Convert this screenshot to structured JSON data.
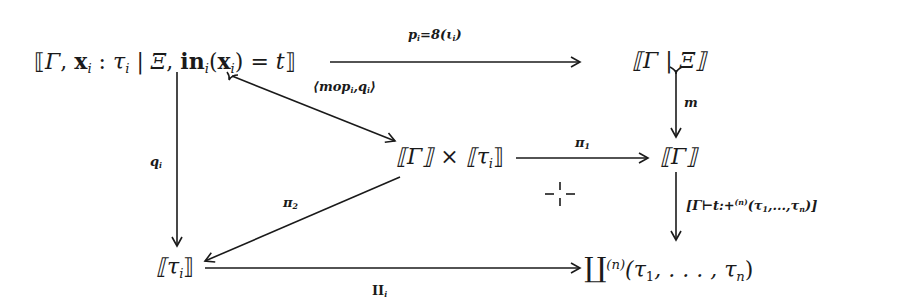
{
  "diagram": {
    "type": "commutative-diagram",
    "nodes": {
      "top_left": {
        "open": "⟦",
        "gamma": "Γ",
        "comma1": ", ",
        "x": "x",
        "x_sub": "i",
        "colon": " : ",
        "tau": "τ",
        "tau_sub": "i",
        "bar": " | ",
        "xi": "Ξ",
        "comma2": ", ",
        "in": "in",
        "in_sub": "i",
        "paren_open": "(",
        "x2": "x",
        "x2_sub": "i",
        "paren_close": ")",
        "eq": " = ",
        "t": "t",
        "close": "⟧"
      },
      "top_right": {
        "text": "⟦Γ | Ξ⟧"
      },
      "middle_left": {
        "gamma": "⟦Γ⟧",
        "times": " × ",
        "tau_open": "⟦τ",
        "tau_sub": "i",
        "tau_close": "⟧"
      },
      "middle_right": {
        "text": "⟦Γ⟧"
      },
      "bottom_left": {
        "open": "⟦τ",
        "sub": "i",
        "close": "⟧"
      },
      "bottom_right": {
        "coprod": "∐",
        "sup": "(n)",
        "args": "(τ",
        "s1": "1",
        "mid": ", . . . , τ",
        "sn": "n",
        "close": ")"
      }
    },
    "arrows": {
      "top": {
        "label_main": "p",
        "label_sub": "i",
        "label_rest": "=8(ι",
        "label_sub2": "i",
        "label_close": ")",
        "from": "top_left",
        "to": "top_right"
      },
      "diag_mop": {
        "label": "⟨mop",
        "label_sub": "i",
        "label_mid": ",q",
        "label_sub2": "i",
        "label_close": "⟩",
        "from": "top_left",
        "to": "middle_left"
      },
      "m": {
        "label": "m",
        "from": "top_right",
        "to": "middle_right"
      },
      "q": {
        "label": "q",
        "label_sub": "i",
        "from": "top_left",
        "to": "bottom_left"
      },
      "pi1": {
        "label": "π",
        "label_sub": "1",
        "from": "middle_left",
        "to": "middle_right"
      },
      "pi2": {
        "label": "π",
        "label_sub": "2",
        "from": "middle_left",
        "to": "bottom_left"
      },
      "judgement": {
        "label": "[Γ⊢t:+",
        "label_sup": "(n)",
        "label_rest": "(τ",
        "s1": "1",
        "mid": ",...,τ",
        "sn": "n",
        "close": ")]",
        "from": "middle_right",
        "to": "bottom_right"
      },
      "coproj": {
        "label": "II",
        "label_sub": "i",
        "from": "bottom_left",
        "to": "bottom_right"
      }
    },
    "pullback_marker": "-|-"
  }
}
